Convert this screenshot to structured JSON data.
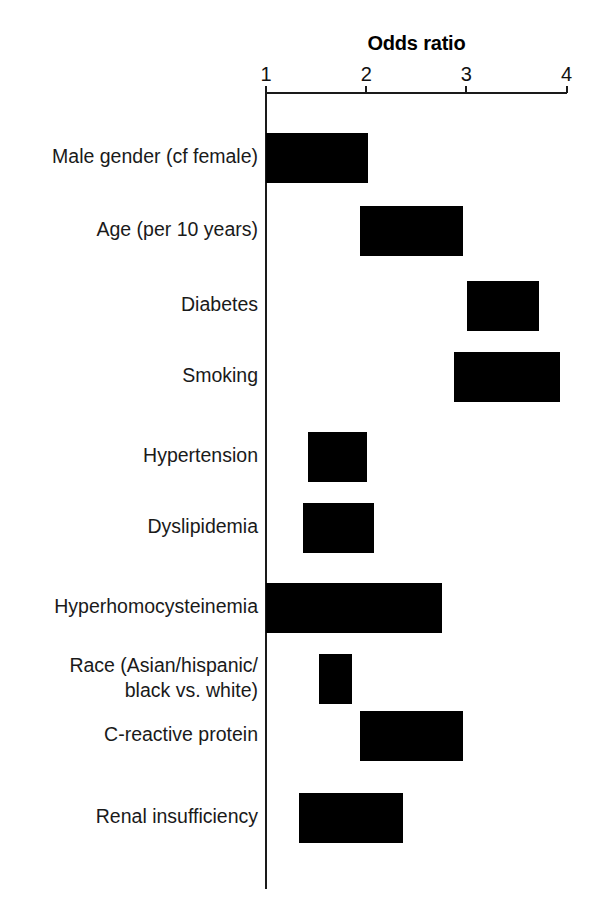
{
  "chart_data": {
    "type": "bar",
    "orientation": "horizontal",
    "title": "Odds ratio",
    "xlabel": "",
    "ylabel": "",
    "xlim": [
      1,
      4
    ],
    "xticks": [
      1,
      2,
      3,
      4
    ],
    "xtick_labels": [
      "1",
      "2",
      "3",
      "4"
    ],
    "grid": false,
    "legend": null,
    "bar_color": "#000000",
    "axis_color": "#1a1a1a",
    "note": "Floating bars: each bar spans a low-to-high odds ratio interval.",
    "categories": [
      "Male gender (cf female)",
      "Age (per 10 years)",
      "Diabetes",
      "Smoking",
      "Hypertension",
      "Dyslipidemia",
      "Hyperhomocysteinemia",
      "Race (Asian/hispanic/\nblack vs. white)",
      "C-reactive protein",
      "Renal insufficiency"
    ],
    "bars": [
      {
        "label": "Male gender (cf female)",
        "low": 1.0,
        "high": 2.02
      },
      {
        "label": "Age (per 10 years)",
        "low": 1.94,
        "high": 2.97
      },
      {
        "label": "Diabetes",
        "low": 3.01,
        "high": 3.72
      },
      {
        "label": "Smoking",
        "low": 2.88,
        "high": 3.93
      },
      {
        "label": "Hypertension",
        "low": 1.42,
        "high": 2.01
      },
      {
        "label": "Dyslipidemia",
        "low": 1.37,
        "high": 2.08
      },
      {
        "label": "Hyperhomocysteinemia",
        "low": 1.0,
        "high": 2.76
      },
      {
        "label": "Race (Asian/hispanic/\nblack vs. white)",
        "low": 1.53,
        "high": 1.86
      },
      {
        "label": "C-reactive protein",
        "low": 1.94,
        "high": 2.97
      },
      {
        "label": "Renal insufficiency",
        "low": 1.33,
        "high": 2.37
      }
    ]
  },
  "layout": {
    "axis_origin_x": 266,
    "px_per_unit": 100.2,
    "row_tops": [
      133,
      206,
      281,
      352,
      432,
      503,
      583,
      654,
      711,
      793
    ],
    "bar_height": 50,
    "label_tops": [
      144,
      217,
      292,
      363,
      443,
      514,
      594,
      653,
      722,
      804
    ]
  }
}
